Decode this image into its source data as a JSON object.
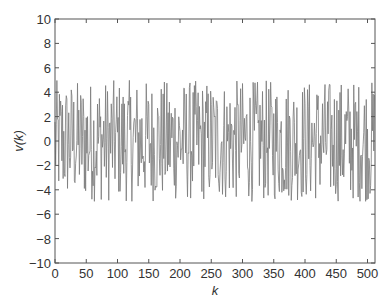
{
  "chart_data": {
    "type": "line",
    "title": "",
    "xlabel": "k",
    "ylabel": "v(k)",
    "xlim": [
      0,
      512
    ],
    "ylim": [
      -10,
      10
    ],
    "grid": false,
    "legend": null,
    "x_ticks": [
      0,
      50,
      100,
      150,
      200,
      250,
      300,
      350,
      400,
      450,
      500
    ],
    "y_ticks": [
      10,
      8,
      6,
      4,
      2,
      0,
      -2,
      -4,
      -6,
      -8,
      -10
    ],
    "series": [
      {
        "name": "v(k)",
        "description": "512-sample zero-mean random noise sequence, approximately uniform in [-5, 5]",
        "n_samples": 512,
        "amplitude_min": -5,
        "amplitude_max": 5,
        "color": "#7a7a7a"
      }
    ]
  },
  "style": {
    "axis_color": "#555555",
    "line_color": "#7a7a7a"
  }
}
